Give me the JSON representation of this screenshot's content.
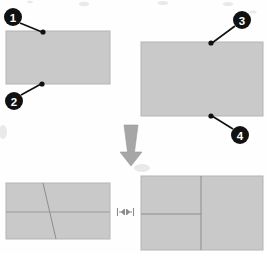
{
  "figure": {
    "type": "instructional-diagram",
    "background_color": "#fefefe",
    "panel_fill_color": "#c9c9c9",
    "panel_edge_color": "#b0b0b0",
    "callout_color": "#111111",
    "line_color": "#8f8f8f",
    "arrow_color": "#a9a9a9"
  },
  "panels": [
    {
      "name": "top-left-sheet",
      "x": 6,
      "y": 31,
      "width": 104,
      "height": 53,
      "lines": []
    },
    {
      "name": "top-right-sheet",
      "x": 141,
      "y": 42,
      "width": 122,
      "height": 74,
      "lines": []
    },
    {
      "name": "bottom-left-sheet",
      "x": 6,
      "y": 183,
      "width": 104,
      "height": 56,
      "lines": [
        {
          "name": "diagonal-fold-line",
          "x1": 43,
          "y1": 183,
          "x2": 56,
          "y2": 239
        },
        {
          "name": "horizontal-fold-line",
          "x1": 6,
          "y1": 212,
          "x2": 110,
          "y2": 212
        }
      ]
    },
    {
      "name": "bottom-right-sheet",
      "x": 141,
      "y": 176,
      "width": 122,
      "height": 74,
      "lines": [
        {
          "name": "vertical-fold-line",
          "x1": 201,
          "y1": 176,
          "x2": 201,
          "y2": 250
        },
        {
          "name": "horizontal-fold-line",
          "x1": 141,
          "y1": 214,
          "x2": 201,
          "y2": 214
        }
      ]
    }
  ],
  "callouts": [
    {
      "label": "1",
      "circle": {
        "cx": 13,
        "cy": 17,
        "r": 9
      },
      "leader": {
        "x1": 20,
        "y1": 23,
        "x2": 42,
        "y2": 32
      },
      "anchor_dot": {
        "cx": 43,
        "cy": 32,
        "r": 2.6
      }
    },
    {
      "label": "2",
      "circle": {
        "cx": 14,
        "cy": 101,
        "r": 9
      },
      "leader": {
        "x1": 21,
        "y1": 95,
        "x2": 41,
        "y2": 84
      },
      "anchor_dot": {
        "cx": 42,
        "cy": 84,
        "r": 2.6
      }
    },
    {
      "label": "3",
      "circle": {
        "cx": 242,
        "cy": 20,
        "r": 9
      },
      "leader": {
        "x1": 235,
        "y1": 26,
        "x2": 212,
        "y2": 43
      },
      "anchor_dot": {
        "cx": 211,
        "cy": 43,
        "r": 2.6
      }
    },
    {
      "label": "4",
      "circle": {
        "cx": 240,
        "cy": 135,
        "r": 9
      },
      "leader": {
        "x1": 233,
        "y1": 129,
        "x2": 212,
        "y2": 116
      },
      "anchor_dot": {
        "cx": 211,
        "cy": 116,
        "r": 2.6
      }
    }
  ],
  "transition_arrow": {
    "name": "down-arrow",
    "direction": "down",
    "x": 118,
    "y": 125,
    "width": 26,
    "height": 40
  },
  "dimension_marker": {
    "name": "width-dimension-icon",
    "x": 117,
    "y": 207,
    "width": 17,
    "height": 10
  }
}
